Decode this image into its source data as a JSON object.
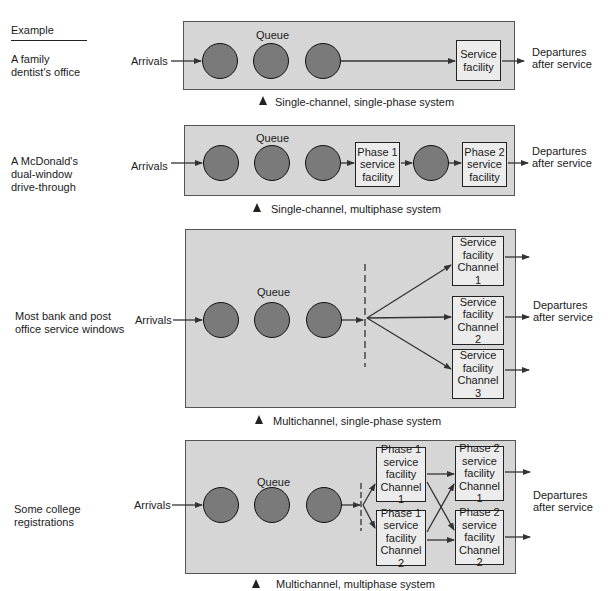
{
  "header": {
    "example_label": "Example"
  },
  "common": {
    "arrivals": "Arrivals",
    "queue": "Queue",
    "departures_line1": "Departures",
    "departures_line2": "after service"
  },
  "systems": [
    {
      "example": [
        "A family",
        "dentist's office"
      ],
      "caption": "Single-channel, single-phase system",
      "facilities": [
        [
          "Service",
          "facility"
        ]
      ]
    },
    {
      "example": [
        "A McDonald's",
        "dual-window",
        "drive-through"
      ],
      "caption": "Single-channel, multiphase system",
      "facilities": [
        [
          "Phase 1",
          "service",
          "facility"
        ],
        [
          "Phase 2",
          "service",
          "facility"
        ]
      ]
    },
    {
      "example": [
        "Most bank and post",
        "office service windows"
      ],
      "caption": "Multichannel, single-phase system",
      "facilities": [
        [
          "Service",
          "facility",
          "Channel 1"
        ],
        [
          "Service",
          "facility",
          "Channel 2"
        ],
        [
          "Service",
          "facility",
          "Channel 3"
        ]
      ]
    },
    {
      "example": [
        "Some college",
        "registrations"
      ],
      "caption": "Multichannel, multiphase system",
      "facilities": [
        [
          "Phase 1",
          "service",
          "facility",
          "Channel 1"
        ],
        [
          "Phase 1",
          "service",
          "facility",
          "Channel 2"
        ],
        [
          "Phase 2",
          "service",
          "facility",
          "Channel 1"
        ],
        [
          "Phase 2",
          "service",
          "facility",
          "Channel 2"
        ]
      ]
    }
  ],
  "colors": {
    "panel": "#d6d6d6",
    "customer": "#7a7a7a",
    "facility": "#ececec",
    "line": "#333333"
  }
}
